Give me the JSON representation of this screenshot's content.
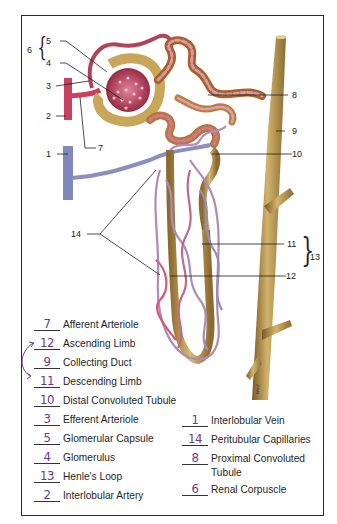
{
  "diagram": {
    "colors": {
      "tubule": "#c9a75a",
      "artery": "#c9475e",
      "vein": "#8b8fc0",
      "capillary": "#c87a8a",
      "collecting_duct": "#b8975a",
      "frame": "#2a2a2a",
      "handwriting": "#6a3a8a"
    },
    "callouts": [
      {
        "id": "1",
        "label": "1"
      },
      {
        "id": "2",
        "label": "2"
      },
      {
        "id": "3",
        "label": "3"
      },
      {
        "id": "4",
        "label": "4"
      },
      {
        "id": "5",
        "label": "5"
      },
      {
        "id": "6",
        "label": "6"
      },
      {
        "id": "7",
        "label": "7"
      },
      {
        "id": "8",
        "label": "8"
      },
      {
        "id": "9",
        "label": "9"
      },
      {
        "id": "10",
        "label": "10"
      },
      {
        "id": "11",
        "label": "11"
      },
      {
        "id": "12",
        "label": "12"
      },
      {
        "id": "13",
        "label": "13"
      },
      {
        "id": "14",
        "label": "14"
      }
    ],
    "watermark_text": "Ward S.B."
  },
  "key": {
    "left": [
      {
        "answer": "7",
        "term": "Afferent Arteriole"
      },
      {
        "answer": "12",
        "term": "Ascending Limb"
      },
      {
        "answer": "9",
        "term": "Collecting Duct"
      },
      {
        "answer": "11",
        "term": "Descending Limb"
      },
      {
        "answer": "10",
        "term": "Distal Convoluted Tubule"
      },
      {
        "answer": "3",
        "term": "Efferent Arteriole"
      },
      {
        "answer": "5",
        "term": "Glomerular Capsule"
      },
      {
        "answer": "4",
        "term": "Glomerulus"
      },
      {
        "answer": "13",
        "term": "Henle's Loop"
      },
      {
        "answer": "2",
        "term": "Interlobular Artery"
      }
    ],
    "right": [
      {
        "answer": "1",
        "term": "Interlobular Vein"
      },
      {
        "answer": "14",
        "term": "Peritubular Capillaries"
      },
      {
        "answer": "8",
        "term": "Proximal Convoluted",
        "term_line2": "Tubule"
      },
      {
        "answer": "6",
        "term": "Renal Corpuscle"
      }
    ],
    "annotation": "hand-drawn arrow linking 12 and 9"
  }
}
